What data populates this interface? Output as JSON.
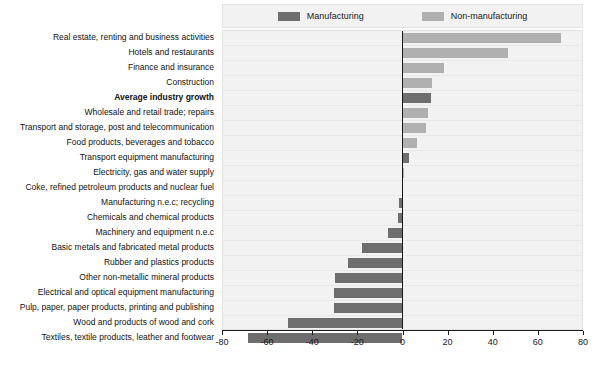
{
  "legend": {
    "position": "top-center",
    "items": [
      {
        "label": "Manufacturing",
        "color": "#6e6e6e"
      },
      {
        "label": "Non-manufacturing",
        "color": "#b0b0b0"
      }
    ]
  },
  "colors": {
    "manufacturing": "#6e6e6e",
    "non_manufacturing": "#b0b0b0",
    "plot_background": "#f2f2f2",
    "axis": "#1a1a1a"
  },
  "chart_data": {
    "type": "bar",
    "orientation": "horizontal",
    "title": "",
    "subtitle": "",
    "xlabel": "",
    "ylabel": "",
    "xlim": [
      -80,
      80
    ],
    "xticks": [
      -80,
      -60,
      -40,
      -20,
      0,
      20,
      40,
      60,
      80
    ],
    "xticklabels": [
      "-80",
      "-60",
      "-40",
      "-20",
      "0",
      "20",
      "40",
      "60",
      "80"
    ],
    "grid": false,
    "legend_position": "top-center",
    "categories": [
      "Real estate, renting and business activities",
      "Hotels and restaurants",
      "Finance and insurance",
      "Construction",
      "Average industry growth",
      "Wholesale and retail trade; repairs",
      "Transport and storage, post and telecommunication",
      "Food products, beverages and tobacco",
      "Transport equipment manufacturing",
      "Electricity, gas and water supply",
      "Coke, refined petroleum products and nuclear fuel",
      "Manufacturing n.e.c; recycling",
      "Chemicals and chemical products",
      "Machinery and equipment n.e.c",
      "Basic metals and fabricated metal products",
      "Rubber and plastics products",
      "Other non-metallic mineral products",
      "Electrical and optical equipment manufacturing",
      "Pulp, paper, paper products, printing and publishing",
      "Wood and products of wood and cork",
      "Textiles, textile products, leather and footwear"
    ],
    "values": [
      70.7,
      46.8,
      18.5,
      13.0,
      12.5,
      11.5,
      10.5,
      6.5,
      3.0,
      0.8,
      0.0,
      -1.5,
      -2.0,
      -6.5,
      -18.0,
      -24.5,
      -30.0,
      -30.5,
      -30.5,
      -51.0,
      -69.0
    ],
    "series_of": [
      "non_manufacturing",
      "non_manufacturing",
      "non_manufacturing",
      "non_manufacturing",
      "manufacturing",
      "non_manufacturing",
      "non_manufacturing",
      "non_manufacturing",
      "manufacturing",
      "non_manufacturing",
      "manufacturing",
      "manufacturing",
      "manufacturing",
      "manufacturing",
      "manufacturing",
      "manufacturing",
      "manufacturing",
      "manufacturing",
      "manufacturing",
      "manufacturing",
      "manufacturing"
    ],
    "bold_categories": [
      "Average industry growth"
    ]
  }
}
